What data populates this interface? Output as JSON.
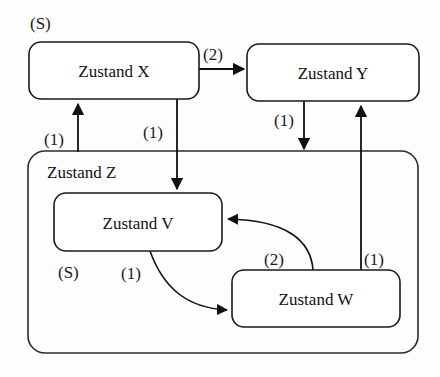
{
  "diagram": {
    "states": [
      {
        "id": "X",
        "label": "Zustand X",
        "x": 29,
        "y": 42,
        "w": 170,
        "h": 57
      },
      {
        "id": "Y",
        "label": "Zustand Y",
        "x": 247,
        "y": 44,
        "w": 172,
        "h": 57
      },
      {
        "id": "Z",
        "label": "Zustand Z",
        "x": 28,
        "y": 151,
        "w": 390,
        "h": 202
      },
      {
        "id": "V",
        "label": "Zustand V",
        "x": 54,
        "y": 193,
        "w": 168,
        "h": 58
      },
      {
        "id": "W",
        "label": "Zustand W",
        "x": 232,
        "y": 270,
        "w": 168,
        "h": 57
      }
    ],
    "markers": [
      {
        "id": "start-x",
        "label": "(S)",
        "x": 30,
        "y": 29
      },
      {
        "id": "start-v",
        "label": "(S)",
        "x": 58,
        "y": 278
      }
    ],
    "transitions": [
      {
        "id": "x-to-y",
        "label": "(2)",
        "from": "X",
        "to": "Y",
        "label_x": 203,
        "label_y": 60
      },
      {
        "id": "x-to-v",
        "label": "(1)",
        "from": "X",
        "to": "V",
        "label_x": 143,
        "label_y": 138
      },
      {
        "id": "z-to-x",
        "label": "(1)",
        "from": "Z",
        "to": "X",
        "label_x": 44,
        "label_y": 145
      },
      {
        "id": "y-to-z",
        "label": "(1)",
        "from": "Y",
        "to": "Z",
        "label_x": 274,
        "label_y": 126
      },
      {
        "id": "w-to-y",
        "label": "(1)",
        "from": "W",
        "to": "Y",
        "label_x": 364,
        "label_y": 265
      },
      {
        "id": "v-to-w",
        "label": "(1)",
        "from": "V",
        "to": "W",
        "label_x": 121,
        "label_y": 279
      },
      {
        "id": "w-to-v",
        "label": "(2)",
        "from": "W",
        "to": "V",
        "label_x": 264,
        "label_y": 265
      }
    ],
    "colors": {
      "background": "#fdfdfd",
      "stroke": "#111111",
      "box_fill": "#ffffff",
      "text": "#111111"
    }
  }
}
